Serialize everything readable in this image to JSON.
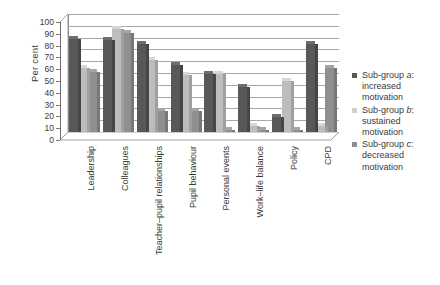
{
  "chart_data": {
    "type": "bar",
    "title": "",
    "subtitle": "",
    "xlabel": "",
    "ylabel": "Per cent",
    "ylim": [
      0,
      100
    ],
    "ytick_step": 10,
    "yticks": [
      100,
      90,
      80,
      70,
      60,
      50,
      40,
      30,
      20,
      10,
      0
    ],
    "grid": true,
    "legend_position": "right",
    "style": "3d-grouped-bars-grayscale",
    "categories": [
      "Leadership",
      "Colleagues",
      "Teacher–pupil relationships",
      "Pupil behaviour",
      "Personal events",
      "Work–life balance",
      "Policy",
      "CPD"
    ],
    "series": [
      {
        "name": "Sub-group a: increased motivation",
        "short": "a",
        "color": "#585858",
        "values": [
          79,
          78,
          75,
          57,
          49,
          38,
          13,
          75
        ]
      },
      {
        "name": "Sub-group b: sustained motivation",
        "short": "b",
        "color": "#cfcfcf",
        "values": [
          54,
          87,
          61,
          48,
          49,
          5,
          43,
          5
        ]
      },
      {
        "name": "Sub-group c: decreased motivation",
        "short": "c",
        "color": "#8f8f8f",
        "values": [
          51,
          84,
          18,
          18,
          2,
          2,
          2,
          54
        ]
      }
    ]
  },
  "axis": {
    "y_title": "Per cent"
  },
  "legend": {
    "items": [
      {
        "line1_prefix": "Sub-group ",
        "line1_em": "a",
        "line1_suffix": ":",
        "line2": "increased",
        "line3": "motivation",
        "swatch_class": "lg-a"
      },
      {
        "line1_prefix": "Sub-group ",
        "line1_em": "b",
        "line1_suffix": ":",
        "line2": "sustained",
        "line3": "motivation",
        "swatch_class": "lg-b"
      },
      {
        "line1_prefix": "Sub-group ",
        "line1_em": "c",
        "line1_suffix": ":",
        "line2": "decreased",
        "line3": "motivation",
        "swatch_class": "lg-c"
      }
    ]
  }
}
